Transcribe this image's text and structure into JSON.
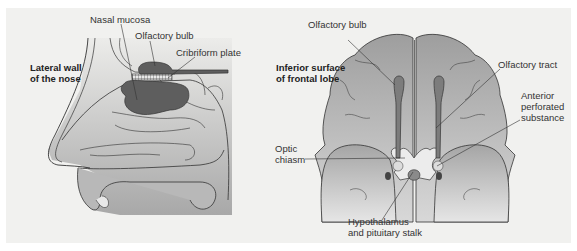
{
  "left_panel": {
    "title_line1": "Lateral wall",
    "title_line2": "of the nose",
    "labels": {
      "nasal_mucosa": "Nasal mucosa",
      "olfactory_bulb": "Olfactory bulb",
      "cribriform_plate": "Cribriform plate"
    }
  },
  "right_panel": {
    "title_line1": "Inferior surface",
    "title_line2": "of frontal lobe",
    "labels": {
      "olfactory_bulb": "Olfactory bulb",
      "olfactory_tract": "Olfactory tract",
      "anterior_perforated_1": "Anterior",
      "anterior_perforated_2": "perforated",
      "anterior_perforated_3": "substance",
      "optic_chiasm_1": "Optic",
      "optic_chiasm_2": "chiasm",
      "hypothalamus_1": "Hypothalamus",
      "hypothalamus_2": "and pituitary stalk"
    }
  },
  "colors": {
    "background": "#f1f1ef",
    "tissue_light": "#c9c9c9",
    "tissue_mid": "#a9a9a9",
    "bulb_dark": "#5e5e5e",
    "outline": "#333333"
  }
}
